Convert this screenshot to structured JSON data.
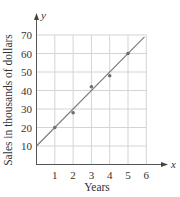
{
  "chart_data": {
    "type": "scatter",
    "title": "",
    "xlabel": "Years",
    "ylabel": "Sales in thousands of dollars",
    "x_axis_var": "x",
    "y_axis_var": "y",
    "xlim": [
      0,
      6
    ],
    "ylim": [
      0,
      70
    ],
    "x_ticks": [
      1,
      2,
      3,
      4,
      5,
      6
    ],
    "y_ticks": [
      10,
      20,
      30,
      40,
      50,
      60,
      70
    ],
    "x_tick_labels": [
      "1",
      "2",
      "3",
      "4",
      "5",
      "6"
    ],
    "y_tick_labels": [
      "10",
      "20",
      "30",
      "40",
      "50",
      "60",
      "70"
    ],
    "grid": true,
    "legend": null,
    "series": [
      {
        "name": "data points",
        "kind": "scatter",
        "x": [
          1,
          2,
          3,
          4,
          5
        ],
        "y": [
          20,
          28,
          42,
          48,
          60
        ]
      },
      {
        "name": "line of best fit",
        "kind": "line",
        "x": [
          0,
          5.9
        ],
        "y": [
          10,
          69
        ]
      }
    ]
  },
  "colors": {
    "grid": "#d4d4d4",
    "axis": "#555555",
    "line": "#7a7a7a",
    "point": "#6e6e6e",
    "text": "#333333"
  }
}
